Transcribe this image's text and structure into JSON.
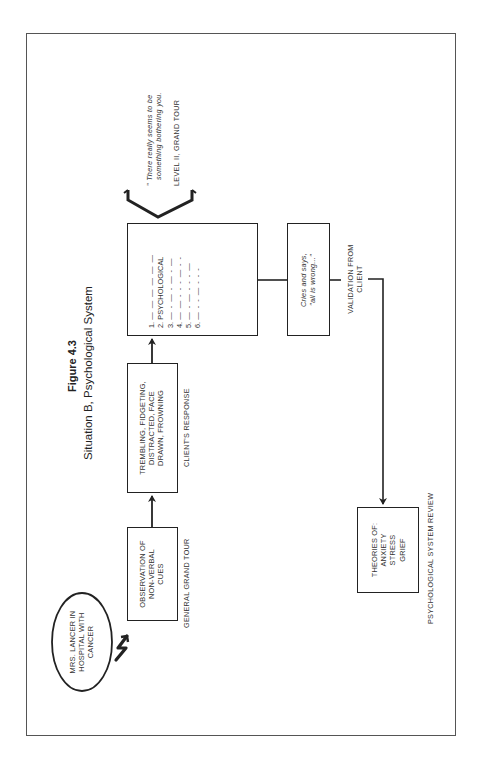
{
  "figure": {
    "number": "Figure 4.3",
    "title": "Situation B, Psychological System"
  },
  "nodes": {
    "patient": {
      "lines": [
        "MRS. LANCER IN",
        "HOSPITAL WITH",
        "CANCER"
      ]
    },
    "observation": {
      "lines": [
        "OBSERVATION OF",
        "NON-VERBAL",
        "CUES"
      ],
      "caption": "GENERAL GRAND TOUR"
    },
    "response": {
      "lines": [
        "TREMBLING, FIDGETING,",
        "DISTRACTED, FACE",
        "DRAWN, FROWNING"
      ],
      "caption": "CLIENT'S RESPONSE"
    },
    "systems": {
      "items": [
        {
          "num": "1.",
          "text": "— — — — — —"
        },
        {
          "num": "2.",
          "text": "PSYCHOLOGICAL"
        },
        {
          "num": "3.",
          "text": "— - — - — - —"
        },
        {
          "num": "4.",
          "text": "— — - - - — - -"
        },
        {
          "num": "5.",
          "text": "— - — - - - —"
        },
        {
          "num": "6.",
          "text": "— - - — - - -"
        }
      ]
    },
    "level_two": {
      "quote_line1": "\" There really seems to be",
      "quote_line2": "something bothering you.",
      "caption": "LEVEL II, GRAND TOUR"
    },
    "validation": {
      "lines": [
        "Cries and says,",
        "\"all is wrong...\""
      ],
      "caption_line1": "VALIDATION FROM",
      "caption_line2": "CLIENT"
    },
    "theories": {
      "lines": [
        "THEORIES OF:",
        "ANXIETY",
        "STRESS",
        "GRIEF"
      ],
      "caption": "PSYCHOLOGICAL SYSTEM REVIEW"
    }
  },
  "colors": {
    "line": "#222222",
    "text": "#333333",
    "frame": "#555555",
    "background": "#ffffff"
  }
}
